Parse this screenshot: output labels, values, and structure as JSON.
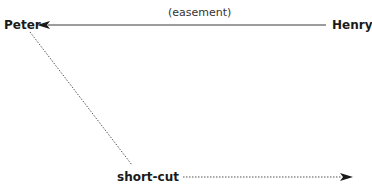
{
  "diagram": {
    "nodes": [
      {
        "id": "peter",
        "label": "Peter"
      },
      {
        "id": "henry",
        "label": "Henry"
      },
      {
        "id": "shortcut",
        "label": "short-cut"
      }
    ],
    "edges": [
      {
        "from": "henry",
        "to": "peter",
        "label": "(easement)",
        "style": "solid",
        "arrow": "to-peter"
      },
      {
        "from": "peter",
        "to": "shortcut",
        "label": "",
        "style": "dotted",
        "arrow": "none"
      },
      {
        "from": "shortcut",
        "to": "right",
        "label": "",
        "style": "dotted",
        "arrow": "right"
      }
    ],
    "colors": {
      "line": "#333333",
      "text": "#1a1a1a",
      "background": "#ffffff"
    }
  }
}
